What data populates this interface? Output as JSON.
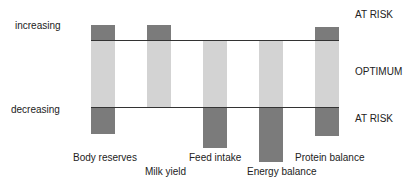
{
  "axis": {
    "top_label": "increasing",
    "bottom_label": "decreasing"
  },
  "zones": {
    "upper": "AT RISK",
    "middle": "OPTIMUM",
    "lower": "AT RISK"
  },
  "indicators": [
    {
      "label": "Body reserves",
      "upper_at_risk": true,
      "lower_at_risk": true
    },
    {
      "label": "Milk yield",
      "upper_at_risk": true,
      "lower_at_risk": false
    },
    {
      "label": "Feed intake",
      "upper_at_risk": false,
      "lower_at_risk": true
    },
    {
      "label": "Energy balance",
      "upper_at_risk": false,
      "lower_at_risk": true
    },
    {
      "label": "Protein balance",
      "upper_at_risk": true,
      "lower_at_risk": true
    }
  ],
  "colors": {
    "optimum_fill": "#d3d3d3",
    "at_risk_fill": "#7b7b7b",
    "threshold_line": "#333333"
  }
}
